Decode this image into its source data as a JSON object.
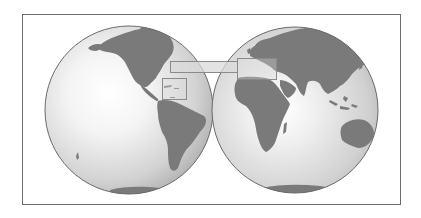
{
  "map": {
    "type": "two-hemisphere world map",
    "frame": {
      "x": 22,
      "y": 14,
      "width": 378,
      "height": 190,
      "stroke": "#6b6b6b"
    },
    "colors": {
      "land": "#7a7a7a",
      "ocean_highlight": "#ffffff",
      "ocean_mid": "#dcdcdc",
      "ocean_rim": "#b0b0b0",
      "globe_outline": "#6a6a6a",
      "highlight_box_stroke": "#8a8a8a",
      "highlight_box_fill": "#d8d8d8"
    },
    "hemispheres": [
      {
        "name": "western-hemisphere",
        "cx": 129,
        "cy": 110,
        "r": 84,
        "regions": [
          "North America",
          "Central America",
          "South America",
          "Antarctica",
          "Pacific Ocean",
          "Atlantic Ocean"
        ]
      },
      {
        "name": "eastern-hemisphere",
        "cx": 295,
        "cy": 110,
        "r": 83,
        "regions": [
          "Europe",
          "Africa",
          "Asia",
          "Australia",
          "Antarctica",
          "Indian Ocean"
        ]
      }
    ],
    "highlight_boxes": [
      {
        "name": "caribbean-box",
        "x": 162,
        "y": 78,
        "width": 24,
        "height": 21
      },
      {
        "name": "mediterranean-box",
        "x": 237,
        "y": 58,
        "width": 39,
        "height": 21
      },
      {
        "name": "connector-band",
        "x": 170,
        "y": 61,
        "width": 67,
        "height": 11
      }
    ]
  }
}
